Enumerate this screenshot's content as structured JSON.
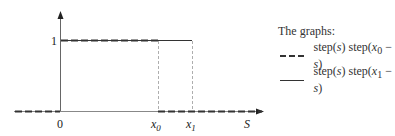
{
  "diagram": {
    "y_tick_label": "1",
    "x_origin_label": "0",
    "x0_label": "x",
    "x0_sub": "0",
    "x1_label": "x",
    "x1_sub": "1",
    "axis_label": "S"
  },
  "legend": {
    "title": "The graphs:",
    "items": [
      {
        "style": "dashed",
        "text_a": "step(",
        "var_a": "s",
        "text_b": ") step(",
        "var_b": "x",
        "sub": "0",
        "text_c": " − ",
        "var_c": "s",
        "text_d": ")"
      },
      {
        "style": "solid",
        "text_a": "step(",
        "var_a": "s",
        "text_b": ") step(",
        "var_b": "x",
        "sub": "1",
        "text_c": " − ",
        "var_c": "s",
        "text_d": ")"
      }
    ]
  }
}
